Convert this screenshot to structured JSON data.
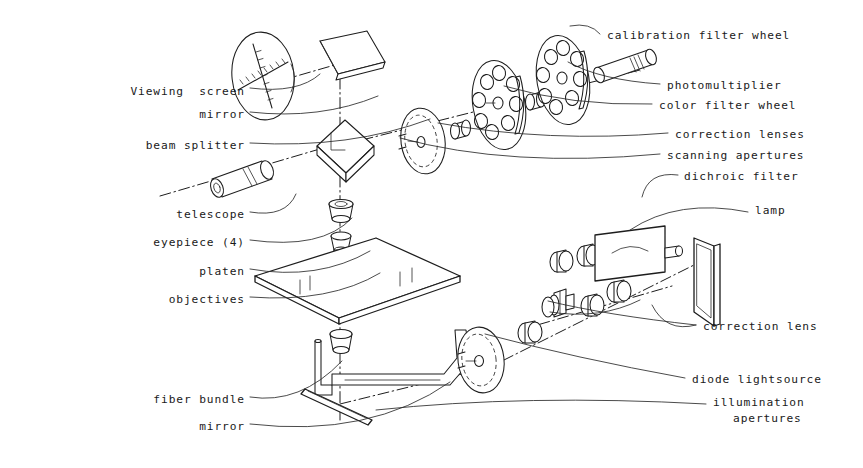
{
  "diagram": {
    "style": {
      "background": "#ffffff",
      "ink": "#1a1a1a",
      "axis_line": "dash-dot"
    },
    "labels_left": [
      {
        "id": "viewing-screen",
        "text": "Viewing  screen",
        "x": 245,
        "y": 92
      },
      {
        "id": "mirror-top",
        "text": "mirror",
        "x": 245,
        "y": 115
      },
      {
        "id": "beam-splitter",
        "text": "beam splitter",
        "x": 245,
        "y": 146
      },
      {
        "id": "telescope",
        "text": "telescope",
        "x": 245,
        "y": 215
      },
      {
        "id": "eyepiece",
        "text": "eyepiece (4)",
        "x": 245,
        "y": 243
      },
      {
        "id": "platen",
        "text": "platen",
        "x": 245,
        "y": 272
      },
      {
        "id": "objectives",
        "text": "objectives",
        "x": 245,
        "y": 300
      },
      {
        "id": "fiber-bundle",
        "text": "fiber bundle",
        "x": 245,
        "y": 400
      },
      {
        "id": "mirror-bottom",
        "text": "mirror",
        "x": 245,
        "y": 427
      }
    ],
    "labels_right": [
      {
        "id": "calibration-filter-wheel",
        "text": "calibration filter wheel",
        "x": 607,
        "y": 36
      },
      {
        "id": "photomultiplier",
        "text": "photomultiplier",
        "x": 667,
        "y": 86
      },
      {
        "id": "color-filter-wheel",
        "text": "color filter wheel",
        "x": 659,
        "y": 106
      },
      {
        "id": "correction-lenses",
        "text": "correction lenses",
        "x": 675,
        "y": 135
      },
      {
        "id": "scanning-apertures",
        "text": "scanning apertures",
        "x": 667,
        "y": 156
      },
      {
        "id": "dichroic-filter",
        "text": "dichroic filter",
        "x": 684,
        "y": 177
      },
      {
        "id": "lamp",
        "text": "lamp",
        "x": 755,
        "y": 211
      },
      {
        "id": "correction-lens",
        "text": "correction lens",
        "x": 703,
        "y": 327
      },
      {
        "id": "diode-lightsource",
        "text": "diode lightsource",
        "x": 692,
        "y": 380
      },
      {
        "id": "illumination-apertures-1",
        "text": "illumination",
        "x": 713,
        "y": 403
      },
      {
        "id": "illumination-apertures-2",
        "text": "apertures",
        "x": 733,
        "y": 419
      }
    ],
    "components": [
      {
        "id": "viewing-screen-disc",
        "kind": "reticle-disc"
      },
      {
        "id": "fold-mirror-top",
        "kind": "flat-plate"
      },
      {
        "id": "beam-splitter-cube",
        "kind": "cube"
      },
      {
        "id": "telescope-tube",
        "kind": "tube"
      },
      {
        "id": "scanning-aperture-disc",
        "kind": "disc"
      },
      {
        "id": "color-filter-wheel-disc",
        "kind": "holed-wheel",
        "holes": 8
      },
      {
        "id": "calibration-filter-wheel-disc",
        "kind": "holed-wheel",
        "holes": 8
      },
      {
        "id": "photomultiplier-tube",
        "kind": "tube"
      },
      {
        "id": "objective-stack",
        "kind": "lens-stack",
        "count": 4
      },
      {
        "id": "platen-plate",
        "kind": "rhombus-plate"
      },
      {
        "id": "fiber-bundle-arm",
        "kind": "arm"
      },
      {
        "id": "bottom-mirror",
        "kind": "thin-mirror"
      },
      {
        "id": "lamp-housing",
        "kind": "box"
      },
      {
        "id": "dichroic-filter-plate",
        "kind": "flat-plate"
      },
      {
        "id": "illumination-aperture-disc",
        "kind": "disc"
      },
      {
        "id": "diode-lightsource-block",
        "kind": "block"
      }
    ]
  }
}
